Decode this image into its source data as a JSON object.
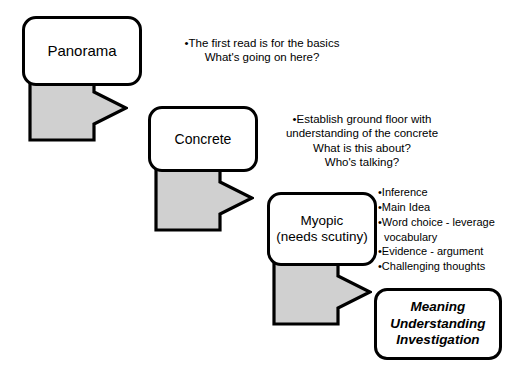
{
  "diagram": {
    "colors": {
      "outline": "#000000",
      "arrow_fill": "#d0d0d0",
      "background": "#ffffff",
      "text": "#000000"
    },
    "nodes": [
      {
        "id": "panorama",
        "label": "Panorama"
      },
      {
        "id": "concrete",
        "label": "Concrete"
      },
      {
        "id": "myopic",
        "label": "Myopic\n(needs scutiny)"
      },
      {
        "id": "outcome",
        "label": "Meaning\nUnderstanding\nInvestigation"
      }
    ],
    "arrows": [
      {
        "id": "arrow-1",
        "from": "panorama",
        "to": "concrete",
        "shape": "bent-arrow-down-right"
      },
      {
        "id": "arrow-2",
        "from": "concrete",
        "to": "myopic",
        "shape": "bent-arrow-down-right"
      },
      {
        "id": "arrow-3",
        "from": "myopic",
        "to": "outcome",
        "shape": "bent-arrow-down-right"
      }
    ],
    "annotations": {
      "panorama": {
        "lines": [
          "•The first read is for the basics",
          "What's going on here?"
        ]
      },
      "concrete": {
        "lines": [
          "•Establish ground floor with",
          "understanding of the concrete",
          "What is this about?",
          "Who's talking?"
        ]
      },
      "myopic": {
        "lines": [
          "•Inference",
          "•Main Idea",
          "•Word choice - leverage",
          "vocabulary",
          "•Evidence - argument",
          "•Challenging thoughts"
        ]
      }
    }
  }
}
